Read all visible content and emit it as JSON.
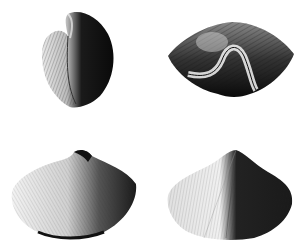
{
  "plate": {
    "subject": "fossil brachiopod shell illustration",
    "background": "#ffffff",
    "ink": "#111111",
    "figures": [
      {
        "view": "lateral-view",
        "position": "top-left"
      },
      {
        "view": "anterior-view",
        "position": "top-right"
      },
      {
        "view": "dorsal-view",
        "position": "bottom-left"
      },
      {
        "view": "ventral-view",
        "position": "bottom-right"
      }
    ]
  }
}
